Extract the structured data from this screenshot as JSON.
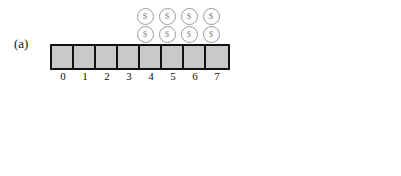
{
  "figure": {
    "background_color": "#ffffff",
    "line_color": "#111111",
    "filled_cell_color": "#c9c9c9",
    "empty_cell_color": "#ffffff",
    "coin_color": "#8a8a8a"
  },
  "panels": [
    {
      "label": "(a)",
      "indices": [
        "0",
        "1",
        "2",
        "3",
        "4",
        "5",
        "6",
        "7"
      ],
      "cells": [
        {
          "index": "0",
          "state": "filled"
        },
        {
          "index": "1",
          "state": "filled"
        },
        {
          "index": "2",
          "state": "filled"
        },
        {
          "index": "3",
          "state": "filled"
        },
        {
          "index": "4",
          "state": "filled"
        },
        {
          "index": "5",
          "state": "filled"
        },
        {
          "index": "6",
          "state": "filled"
        },
        {
          "index": "7",
          "state": "filled"
        }
      ],
      "coin_rows": [
        [
          {
            "over_index": "4",
            "symbol": "$"
          },
          {
            "over_index": "5",
            "symbol": "$"
          },
          {
            "over_index": "6",
            "symbol": "$"
          },
          {
            "over_index": "7",
            "symbol": "$"
          }
        ],
        [
          {
            "over_index": "4",
            "symbol": "$"
          },
          {
            "over_index": "5",
            "symbol": "$"
          },
          {
            "over_index": "6",
            "symbol": "$"
          },
          {
            "over_index": "7",
            "symbol": "$"
          }
        ]
      ]
    },
    {
      "label": "(b)",
      "indices": [
        "0",
        "1",
        "2",
        "3",
        "4",
        "5",
        "6",
        "7",
        "8",
        "9",
        "10",
        "11",
        "12",
        "13",
        "14",
        "15"
      ],
      "cells": [
        {
          "index": "0",
          "state": "filled"
        },
        {
          "index": "1",
          "state": "filled"
        },
        {
          "index": "2",
          "state": "filled"
        },
        {
          "index": "3",
          "state": "filled"
        },
        {
          "index": "4",
          "state": "filled"
        },
        {
          "index": "5",
          "state": "filled"
        },
        {
          "index": "6",
          "state": "filled"
        },
        {
          "index": "7",
          "state": "filled"
        },
        {
          "index": "8",
          "state": "filled"
        },
        {
          "index": "9",
          "state": "empty"
        },
        {
          "index": "10",
          "state": "empty"
        },
        {
          "index": "11",
          "state": "empty"
        },
        {
          "index": "12",
          "state": "empty"
        },
        {
          "index": "13",
          "state": "empty"
        },
        {
          "index": "14",
          "state": "empty"
        },
        {
          "index": "15",
          "state": "empty"
        }
      ],
      "coin_rows": [
        [
          {
            "over_index": "8",
            "symbol": "$"
          }
        ],
        [
          {
            "over_index": "8",
            "symbol": "$"
          }
        ]
      ]
    }
  ]
}
